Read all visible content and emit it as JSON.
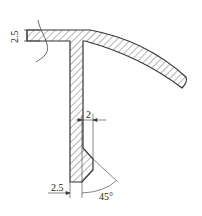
{
  "diagram": {
    "type": "technical-section-drawing",
    "dimensions": {
      "flange_thickness": "2.5",
      "web_offset": "2",
      "web_thickness": "2.5",
      "chamfer_angle": "45°"
    },
    "colors": {
      "line": "#333333",
      "background": "#ffffff"
    }
  }
}
